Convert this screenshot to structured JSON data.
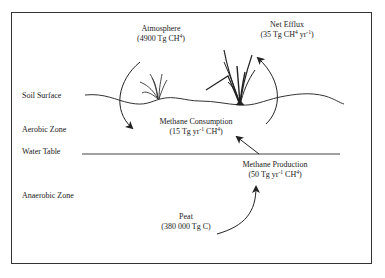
{
  "diagram": {
    "zones": [
      {
        "id": "soil-surface",
        "label": "Soil Surface"
      },
      {
        "id": "aerobic-zone",
        "label": "Aerobic Zone"
      },
      {
        "id": "water-table",
        "label": "Water Table"
      },
      {
        "id": "anaerobic-zone",
        "label": "Anaerobic Zone"
      }
    ],
    "pools": {
      "atmosphere": {
        "title": "Atmosphere",
        "value_prefix": "(4900 Tg CH",
        "value_sup": "4",
        "value_suffix": ")"
      },
      "net_efflux": {
        "title": "Net Efflux",
        "value_prefix": "(35 Tg CH",
        "value_sup": "4",
        "value_mid": " yr",
        "value_sup2": "-1",
        "value_suffix": ")"
      },
      "methane_consumption": {
        "title": "Methane Consumption",
        "value_prefix": "(15 Tg yr",
        "value_sup": "-1",
        "value_mid": " CH",
        "value_sup2": "4",
        "value_suffix": ")"
      },
      "methane_production": {
        "title": "Methane Production",
        "value_prefix": "(50 Tg yr",
        "value_sup": "-1",
        "value_mid": " CH",
        "value_sup2": "4",
        "value_suffix": ")"
      },
      "peat": {
        "title": "Peat",
        "value": "(380 000 Tg C)"
      }
    },
    "flows": [
      {
        "from": "atmosphere",
        "to": "methane_consumption",
        "direction": "downward curved"
      },
      {
        "from": "methane_production",
        "to": "methane_consumption",
        "direction": "upward diagonal"
      },
      {
        "from": "below-soil",
        "to": "net_efflux",
        "direction": "upward curved"
      },
      {
        "from": "peat",
        "to": "methane_production",
        "direction": "upward curved"
      }
    ],
    "colors": {
      "line": "#333333",
      "text": "#222222",
      "background": "#ffffff"
    }
  }
}
